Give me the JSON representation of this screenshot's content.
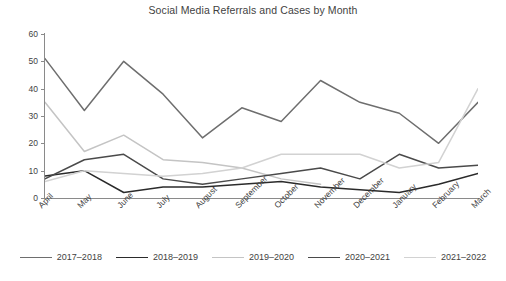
{
  "chart_data": {
    "type": "line",
    "title": "Social Media Referrals and Cases by Month",
    "xlabel": "",
    "ylabel": "",
    "ylim": [
      0,
      60
    ],
    "yticks": [
      0,
      10,
      20,
      30,
      40,
      50,
      60
    ],
    "grid": false,
    "legend_position": "bottom",
    "categories": [
      "April",
      "May",
      "June",
      "July",
      "August",
      "September",
      "October",
      "November",
      "December",
      "January",
      "February",
      "March"
    ],
    "series": [
      {
        "name": "2017–2018",
        "color": "#6e6e6e",
        "values": [
          51,
          32,
          50,
          38,
          22,
          33,
          28,
          43,
          35,
          31,
          20,
          35
        ]
      },
      {
        "name": "2018–2019",
        "color": "#2b2b2b",
        "values": [
          8,
          10,
          2,
          4,
          4,
          5,
          6,
          4,
          3,
          2,
          5,
          9
        ]
      },
      {
        "name": "2019–2020",
        "color": "#c4c4c4",
        "values": [
          35,
          17,
          23,
          14,
          13,
          11,
          7,
          5,
          null,
          null,
          null,
          null
        ]
      },
      {
        "name": "2020–2021",
        "color": "#4a4a4a",
        "values": [
          7,
          14,
          16,
          7,
          5,
          7,
          9,
          11,
          7,
          16,
          11,
          12
        ]
      },
      {
        "name": "2021–2022",
        "color": "#d2d2d2",
        "values": [
          6,
          10,
          9,
          8,
          9,
          11,
          16,
          16,
          16,
          11,
          13,
          40
        ]
      }
    ]
  },
  "legend": {
    "items": [
      {
        "label": "2017–2018",
        "color": "#6e6e6e"
      },
      {
        "label": "2018–2019",
        "color": "#2b2b2b"
      },
      {
        "label": "2019–2020",
        "color": "#c4c4c4"
      },
      {
        "label": "2020–2021",
        "color": "#4a4a4a"
      },
      {
        "label": "2021–2022",
        "color": "#d2d2d2"
      }
    ]
  }
}
